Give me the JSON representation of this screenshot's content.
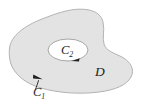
{
  "figure": {
    "type": "math-diagram",
    "background_color": "#ffffff",
    "region": {
      "name": "region-d",
      "label": "D",
      "label_subscript": "",
      "fill_color": "#e3e3e3",
      "stroke_color": "#b3b3b3",
      "stroke_width": 1,
      "label_position": {
        "x": 99,
        "y": 72
      }
    },
    "hole": {
      "name": "inner-hole",
      "fill_color": "#ffffff",
      "stroke_color": "#a8a8a8",
      "stroke_width": 1,
      "center": {
        "x": 68,
        "y": 50
      },
      "radius_x": 20,
      "radius_y": 11
    },
    "curves": [
      {
        "id": "c1",
        "label": "C",
        "subscript": "1",
        "role": "outer boundary",
        "label_position": {
          "x": 33,
          "y": 96
        },
        "arrow_position": {
          "x": 38,
          "y": 77
        },
        "arrow_direction": "right-down",
        "color": "#231f20"
      },
      {
        "id": "c2",
        "label": "C",
        "subscript": "2",
        "role": "inner boundary",
        "label_position": {
          "x": 61,
          "y": 54
        },
        "arrow_position": {
          "x": 75,
          "y": 60
        },
        "arrow_direction": "left",
        "color": "#231f20"
      }
    ],
    "leader_lines": [
      {
        "name": "c1-leader",
        "from": {
          "x": 36,
          "y": 90
        },
        "to": {
          "x": 40,
          "y": 80
        }
      }
    ]
  }
}
